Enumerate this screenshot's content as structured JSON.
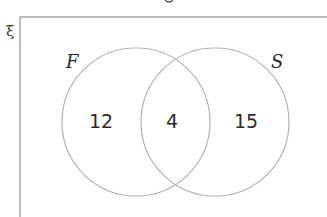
{
  "diagram": {
    "type": "venn",
    "universal_symbol": "ξ",
    "sets": [
      {
        "label": "F",
        "only_value": "12"
      },
      {
        "label": "S",
        "only_value": "15"
      }
    ],
    "intersection_value": "4",
    "colors": {
      "outline": "#b3b3b3",
      "box": "#a8a8a8",
      "text": "#2a2a2a"
    }
  }
}
